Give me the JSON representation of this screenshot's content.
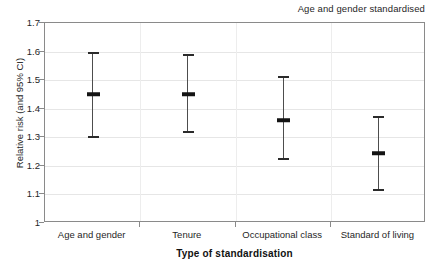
{
  "annotation": "Age and gender standardised",
  "chart_data": {
    "type": "scatter",
    "title": "",
    "subtitle": "Age and gender standardised",
    "xlabel": "Type of standardisation",
    "ylabel": "Relative risk (and 95% CI)",
    "ylim": [
      1,
      1.7
    ],
    "yticks": [
      "1",
      "1.1",
      "1.2",
      "1.3",
      "1.4",
      "1.5",
      "1.6",
      "1.7"
    ],
    "ytick_values": [
      1,
      1.1,
      1.2,
      1.3,
      1.4,
      1.5,
      1.6,
      1.7
    ],
    "grid": true,
    "legend": "none",
    "categories": [
      "Age and gender",
      "Tenure",
      "Occupational class",
      "Standard of living"
    ],
    "values": [
      1.45,
      1.45,
      1.36,
      1.245
    ],
    "ci_lower": [
      1.3,
      1.32,
      1.225,
      1.115
    ],
    "ci_upper": [
      1.6,
      1.59,
      1.515,
      1.375
    ],
    "points": [
      {
        "category": "Age and gender",
        "estimate": 1.45,
        "lower": 1.3,
        "upper": 1.6
      },
      {
        "category": "Tenure",
        "estimate": 1.45,
        "lower": 1.32,
        "upper": 1.59
      },
      {
        "category": "Occupational class",
        "estimate": 1.36,
        "lower": 1.225,
        "upper": 1.515
      },
      {
        "category": "Standard of living",
        "estimate": 1.245,
        "lower": 1.115,
        "upper": 1.375
      }
    ],
    "colors": {
      "marker": "#141414",
      "whisker": "#4d4d4d",
      "axis": "#8a8a8a",
      "grid": "#e6e6e6",
      "text": "#1f1f1f"
    }
  }
}
